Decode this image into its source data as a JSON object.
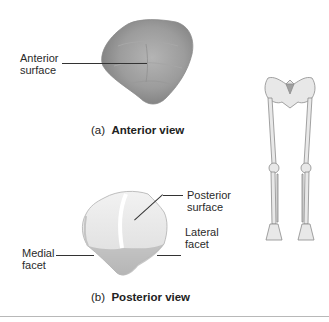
{
  "figure": {
    "panel_a": {
      "caption_prefix": "(a)",
      "caption_title": "Anterior view",
      "labels": {
        "anterior_surface_line1": "Anterior",
        "anterior_surface_line2": "surface"
      }
    },
    "panel_b": {
      "caption_prefix": "(b)",
      "caption_title": "Posterior view",
      "labels": {
        "posterior_surface_line1": "Posterior",
        "posterior_surface_line2": "surface",
        "medial_facet_line1": "Medial",
        "medial_facet_line2": "facet",
        "lateral_facet_line1": "Lateral",
        "lateral_facet_line2": "facet"
      }
    },
    "colors": {
      "bone_anterior": "#9a9a9a",
      "bone_posterior": "#e6e6e6",
      "leader_line": "#333333",
      "rule": "#b8b8b8"
    }
  }
}
